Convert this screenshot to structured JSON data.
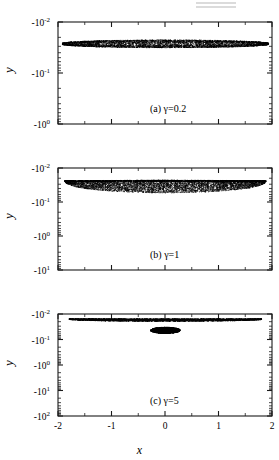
{
  "figure": {
    "width": 279,
    "height": 460,
    "background": "#ffffff",
    "ink": "#000000",
    "axis_label_x": "x",
    "axis_label_y": "y",
    "partial_top_artifact": true
  },
  "chart_data": [
    {
      "type": "scatter",
      "panel_id": "a",
      "panel_label": "(a)",
      "annotation": "γ=0.2",
      "gamma": 0.2,
      "title": "",
      "xlabel": "",
      "ylabel": "y",
      "xlim": [
        -2,
        2
      ],
      "xticks": [
        -2,
        -1,
        0,
        1,
        2
      ],
      "xticklabels": [
        "-2",
        "-1",
        "0",
        "1",
        "2"
      ],
      "yscale": "negative-log",
      "ylim": [
        "-10^-2",
        "-10^0"
      ],
      "yticks": [
        "-10^-2",
        "-10^-1",
        "-10^0"
      ],
      "yticklabels": [
        "-10",
        "-10",
        "-10"
      ],
      "ytickexponents": [
        "-2",
        "-1",
        "0"
      ],
      "grid": false,
      "legend": false,
      "marker_color": "#000000",
      "point_count": 5200,
      "shape": "lens",
      "shape_description": "thin horizontal lens/ellipse spanning nearly full x-range, centered near y=-0.04",
      "cloud": {
        "x_center": 0.0,
        "x_half_width": 1.93,
        "y_center_decade": 0.42,
        "thickness_decade_center": 0.155,
        "thickness_decade_edge": 0.02,
        "top_edge_sharp": false,
        "density_profile": "uniform-dense"
      }
    },
    {
      "type": "scatter",
      "panel_id": "b",
      "panel_label": "(b)",
      "annotation": "γ=1",
      "gamma": 1,
      "title": "",
      "xlabel": "",
      "ylabel": "y",
      "xlim": [
        -2,
        2
      ],
      "xticks": [
        -2,
        -1,
        0,
        1,
        2
      ],
      "xticklabels": [
        "-2",
        "-1",
        "0",
        "1",
        "2"
      ],
      "yscale": "negative-log",
      "ylim": [
        "-10^-2",
        "-10^1"
      ],
      "yticks": [
        "-10^-2",
        "-10^-1",
        "-10^0",
        "-10^1"
      ],
      "yticklabels": [
        "-10",
        "-10",
        "-10",
        "-10"
      ],
      "ytickexponents": [
        "-2",
        "-1",
        "0",
        "1"
      ],
      "grid": false,
      "legend": false,
      "marker_color": "#000000",
      "point_count": 6000,
      "shape": "crescent",
      "shape_description": "broad wedge: flat dark top edge near -10^-1, deep rounded bottom dipping past -10^0 at x=0",
      "cloud": {
        "x_half_width": 1.88,
        "top_decade": 0.345,
        "bottom_decade_center": 0.72,
        "bottom_decade_edge": 0.355,
        "top_edge_sharp": true,
        "density_profile": "dense-top-sparse-bottom"
      }
    },
    {
      "type": "scatter",
      "panel_id": "c",
      "panel_label": "(c)",
      "annotation": "γ=5",
      "gamma": 5,
      "title": "",
      "xlabel": "x",
      "ylabel": "y",
      "xlim": [
        -2,
        2
      ],
      "xticks": [
        -2,
        -1,
        0,
        1,
        2
      ],
      "xticklabels": [
        "-2",
        "-1",
        "0",
        "1",
        "2"
      ],
      "yscale": "negative-log",
      "ylim": [
        "-10^-2",
        "-10^2"
      ],
      "yticks": [
        "-10^-2",
        "-10^-1",
        "-10^0",
        "-10^1",
        "-10^2"
      ],
      "yticklabels": [
        "-10",
        "-10",
        "-10",
        "-10",
        "-10"
      ],
      "ytickexponents": [
        "-2",
        "-1",
        "0",
        "1",
        "2"
      ],
      "grid": false,
      "legend": false,
      "marker_color": "#000000",
      "clusters": [
        {
          "name": "upper-band",
          "point_count": 4200,
          "shape": "lens",
          "shape_description": "wide sagging lens band near -10^-1 spanning x from -1.8 to 1.8",
          "x_half_width": 1.8,
          "y_center_decade": 0.215,
          "thickness_decade": 0.085,
          "density_profile": "dense-top-sparse-bottom"
        },
        {
          "name": "lower-blob",
          "point_count": 2100,
          "shape": "rounded-blob",
          "shape_description": "dense compact rounded cluster centered at x=0 between -10^0 and -10^1",
          "x_center": 0.0,
          "x_half_width": 0.28,
          "y_top_decade": 0.5,
          "y_bottom_decade": 0.75,
          "density_profile": "uniform-very-dense"
        }
      ]
    }
  ]
}
